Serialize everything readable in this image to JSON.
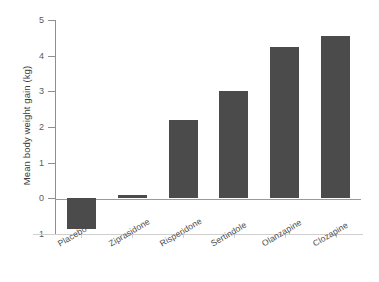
{
  "chart_data": {
    "type": "bar",
    "title": "",
    "subtitle": "",
    "xlabel": "",
    "ylabel": "Mean body weight gain (kg)",
    "categories": [
      "Placebo",
      "Ziprasidone",
      "Risperidone",
      "Sertindole",
      "Olanzapine",
      "Clozapine"
    ],
    "values": [
      -0.85,
      0.1,
      2.2,
      3.0,
      4.25,
      4.55
    ],
    "series": [
      {
        "name": "Mean body weight gain (kg)",
        "values": [
          -0.85,
          0.1,
          2.2,
          3.0,
          4.25,
          4.55
        ]
      }
    ],
    "ylim": [
      -1,
      5
    ],
    "yticks": [
      -1,
      0,
      1,
      2,
      3,
      4,
      5
    ],
    "ytick_labels": [
      "-1",
      "0",
      "1",
      "2",
      "3",
      "4",
      "5"
    ],
    "grid": false,
    "legend": false,
    "legend_position": "none",
    "bar_color": "#4b4b4b",
    "axis_color": "#8e8e8e",
    "zero_line": 0,
    "annotations": []
  },
  "figure": {
    "background": "#ffffff",
    "text_color": "#4d4d4d"
  }
}
